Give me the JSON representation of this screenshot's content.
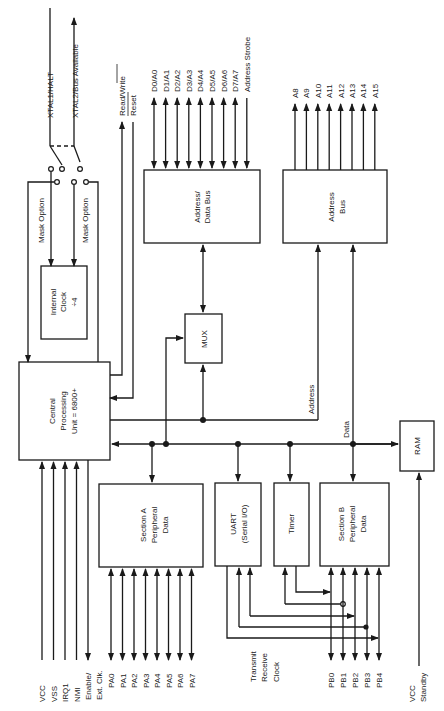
{
  "diagram": {
    "blocks": {
      "cpu": [
        "Central",
        "Processing",
        "Unit = 6800+"
      ],
      "clock": [
        "Internal",
        "Clock",
        "÷4"
      ],
      "addr_data_bus": [
        "Address/",
        "Data Bus"
      ],
      "mux": [
        "MUX"
      ],
      "address_bus": [
        "Address",
        "Bus"
      ],
      "ram": [
        "RAM"
      ],
      "section_a": [
        "Section A",
        "Peripheral",
        "Data"
      ],
      "uart": [
        "UART",
        "(Serial I/O)"
      ],
      "timer": [
        "Timer"
      ],
      "section_b": [
        "Section B",
        "Peripheral",
        "Data"
      ]
    },
    "labels": {
      "xtal1": "XTAL1/HALT",
      "xtal2": "XTAL2/Bus Available",
      "mask_option_1": "Mask Option",
      "mask_option_2": "Mask Option",
      "read_write": "Read/Write",
      "reset": "Reset",
      "address_strobe": "Address Strobe",
      "address": "Address",
      "data": "Data",
      "transmit": "Transmit",
      "receive": "Receive",
      "clock": "Clock",
      "vcc_standby_1": "VCC",
      "vcc_standby_2": "Standby",
      "enable_1": "Enable/",
      "enable_2": "Ext. Clk."
    },
    "data_lines": [
      "D0/A0",
      "D1/A1",
      "D2/A2",
      "D3/A3",
      "D4/A4",
      "D5/A5",
      "D6/A6",
      "D7/A7"
    ],
    "addr_lines": [
      "A8",
      "A9",
      "A10",
      "A11",
      "A12",
      "A13",
      "A14",
      "A15"
    ],
    "cpu_inputs": [
      "VCC",
      "VSS",
      "IRQ1",
      "NMI"
    ],
    "port_a": [
      "PA0",
      "PA1",
      "PA2",
      "PA3",
      "PA4",
      "PA5",
      "PA6",
      "PA7"
    ],
    "port_b": [
      "PB0",
      "PB1",
      "PB2",
      "PB3",
      "PB4"
    ]
  }
}
